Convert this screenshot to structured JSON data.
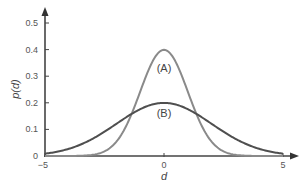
{
  "chart_data": {
    "type": "line",
    "title": "",
    "xlabel": "d",
    "ylabel": "p(d)",
    "xlim": [
      -5,
      5
    ],
    "ylim": [
      0,
      0.5
    ],
    "grid": false,
    "legend": "none (curves labeled inline)",
    "x_ticks": [
      "-5",
      "0",
      "5"
    ],
    "y_ticks": [
      "0",
      "0.1",
      "0.2",
      "0.3",
      "0.4",
      "0.5"
    ],
    "x": [
      -5,
      -4.5,
      -4,
      -3.5,
      -3,
      -2.5,
      -2,
      -1.5,
      -1,
      -0.5,
      0,
      0.5,
      1,
      1.5,
      2,
      2.5,
      3,
      3.5,
      4,
      4.5,
      5
    ],
    "series": [
      {
        "name": "(A)",
        "color": "#8a8a8a",
        "values": [
          1.5e-06,
          1.6e-05,
          0.000134,
          0.000873,
          0.00443,
          0.0175,
          0.054,
          0.1295,
          0.242,
          0.352,
          0.399,
          0.352,
          0.242,
          0.1295,
          0.054,
          0.0175,
          0.00443,
          0.000873,
          0.000134,
          1.6e-05,
          1.5e-06
        ]
      },
      {
        "name": "(B)",
        "color": "#4f4f4f",
        "values": [
          0.0088,
          0.0158,
          0.027,
          0.0431,
          0.0648,
          0.0913,
          0.121,
          0.1506,
          0.176,
          0.1933,
          0.1995,
          0.1933,
          0.176,
          0.1506,
          0.121,
          0.0913,
          0.0648,
          0.0431,
          0.027,
          0.0158,
          0.0088
        ]
      }
    ],
    "annotations": [
      {
        "text": "(A)",
        "x": 0,
        "y": 0.33
      },
      {
        "text": "(B)",
        "x": 0,
        "y": 0.16
      }
    ]
  },
  "axis_color": "#444444"
}
